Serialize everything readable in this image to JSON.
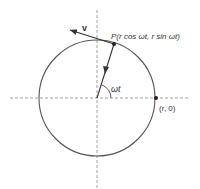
{
  "diagram": {
    "labels": {
      "point_p": "P(r cos ωt, r sin ωt)",
      "velocity": "v",
      "angle": "ωt",
      "point_r0": "(r, 0)"
    },
    "geometry": {
      "center": [
        97,
        98
      ],
      "radius": 58,
      "point_p": [
        114,
        44
      ],
      "velocity_tip": [
        70,
        30
      ]
    },
    "colors": {
      "stroke": "#555555",
      "axis": "#888888",
      "text": "#333333"
    }
  }
}
